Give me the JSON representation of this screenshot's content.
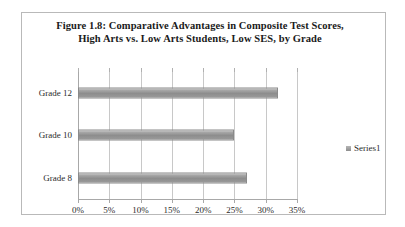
{
  "figure": {
    "title": "Figure 1.8:  Comparative Advantages in Composite Test Scores, High Arts vs. Low Arts Students, Low SES, by Grade",
    "border_color": "#b9b9b9",
    "background": "#ffffff"
  },
  "legend": {
    "position": "right",
    "entries": [
      {
        "label": "Series1",
        "color": "#8d8d8d",
        "swatch_icon": "legend-square-icon"
      }
    ]
  },
  "chart_data": {
    "type": "bar",
    "orientation": "horizontal",
    "title": "Figure 1.8:  Comparative Advantages in Composite Test Scores, High Arts vs. Low Arts Students, Low SES, by Grade",
    "xlabel": "",
    "ylabel": "",
    "categories": [
      "Grade 12",
      "Grade 10",
      "Grade 8"
    ],
    "series": [
      {
        "name": "Series1",
        "values": [
          32,
          25,
          27
        ],
        "color": "#8d8d8d"
      }
    ],
    "xlim": [
      0,
      35
    ],
    "xticks": [
      0,
      5,
      10,
      15,
      20,
      25,
      30,
      35
    ],
    "xticklabels": [
      "0%",
      "5%",
      "10%",
      "15%",
      "20%",
      "25%",
      "30%",
      "35%"
    ],
    "value_format": "percent",
    "grid": "vertical",
    "legend_position": "right"
  }
}
